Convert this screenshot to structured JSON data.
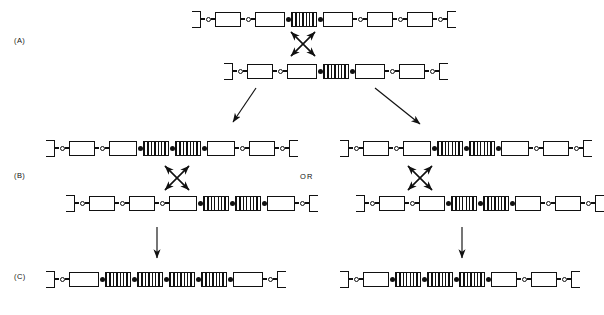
{
  "figure": {
    "ink_color": "#111111",
    "background": "#ffffff"
  },
  "labels": {
    "panel_a": "(A)",
    "panel_b": "(B)",
    "panel_c": "(C)",
    "or": "OR"
  },
  "legend_semantics": {
    "hatch_box": "amplified repeat unit",
    "open_box": "flanking segment",
    "filled_dot": "junction between repeat units",
    "open_dot": "junction between flanking segments",
    "cap": "chromosome arm terminus"
  },
  "rows": {
    "a_top": {
      "name": "chromatid-a1",
      "left_px": 192,
      "top_px": 8,
      "elements": [
        {
          "t": "cap",
          "side": "left",
          "w": 9
        },
        {
          "t": "link",
          "w": 4
        },
        {
          "t": "open"
        },
        {
          "t": "link",
          "w": 4
        },
        {
          "t": "box",
          "w": 26
        },
        {
          "t": "link",
          "w": 4
        },
        {
          "t": "open"
        },
        {
          "t": "link",
          "w": 4
        },
        {
          "t": "box",
          "w": 30
        },
        {
          "t": "fill"
        },
        {
          "t": "hatch",
          "w": 26
        },
        {
          "t": "fill"
        },
        {
          "t": "box",
          "w": 30
        },
        {
          "t": "link",
          "w": 4
        },
        {
          "t": "open"
        },
        {
          "t": "link",
          "w": 4
        },
        {
          "t": "box",
          "w": 26
        },
        {
          "t": "link",
          "w": 4
        },
        {
          "t": "open"
        },
        {
          "t": "link",
          "w": 4
        },
        {
          "t": "box",
          "w": 26
        },
        {
          "t": "link",
          "w": 4
        },
        {
          "t": "open"
        },
        {
          "t": "link",
          "w": 4
        },
        {
          "t": "cap",
          "side": "right",
          "w": 9
        }
      ]
    },
    "a_bottom": {
      "name": "chromatid-a2",
      "left_px": 224,
      "top_px": 60,
      "elements": [
        {
          "t": "cap",
          "side": "left",
          "w": 9
        },
        {
          "t": "link",
          "w": 4
        },
        {
          "t": "open"
        },
        {
          "t": "link",
          "w": 4
        },
        {
          "t": "box",
          "w": 26
        },
        {
          "t": "link",
          "w": 4
        },
        {
          "t": "open"
        },
        {
          "t": "link",
          "w": 4
        },
        {
          "t": "box",
          "w": 30
        },
        {
          "t": "fill"
        },
        {
          "t": "hatch",
          "w": 26
        },
        {
          "t": "fill"
        },
        {
          "t": "box",
          "w": 30
        },
        {
          "t": "link",
          "w": 4
        },
        {
          "t": "open"
        },
        {
          "t": "link",
          "w": 4
        },
        {
          "t": "box",
          "w": 26
        },
        {
          "t": "link",
          "w": 4
        },
        {
          "t": "open"
        },
        {
          "t": "link",
          "w": 4
        },
        {
          "t": "cap",
          "side": "right",
          "w": 9
        }
      ]
    },
    "b_left_top": {
      "name": "chromatid-b-left-1",
      "left_px": 46,
      "top_px": 137,
      "elements": [
        {
          "t": "cap",
          "side": "left",
          "w": 9
        },
        {
          "t": "link",
          "w": 4
        },
        {
          "t": "open"
        },
        {
          "t": "link",
          "w": 4
        },
        {
          "t": "box",
          "w": 26
        },
        {
          "t": "link",
          "w": 4
        },
        {
          "t": "open"
        },
        {
          "t": "link",
          "w": 4
        },
        {
          "t": "box",
          "w": 28
        },
        {
          "t": "fill"
        },
        {
          "t": "hatch",
          "w": 26
        },
        {
          "t": "fill"
        },
        {
          "t": "hatch",
          "w": 26
        },
        {
          "t": "fill"
        },
        {
          "t": "box",
          "w": 28
        },
        {
          "t": "link",
          "w": 4
        },
        {
          "t": "open"
        },
        {
          "t": "link",
          "w": 4
        },
        {
          "t": "box",
          "w": 26
        },
        {
          "t": "link",
          "w": 4
        },
        {
          "t": "open"
        },
        {
          "t": "link",
          "w": 4
        },
        {
          "t": "cap",
          "side": "right",
          "w": 9
        }
      ]
    },
    "b_left_bottom": {
      "name": "chromatid-b-left-2",
      "left_px": 66,
      "top_px": 192,
      "elements": [
        {
          "t": "cap",
          "side": "left",
          "w": 9
        },
        {
          "t": "link",
          "w": 4
        },
        {
          "t": "open"
        },
        {
          "t": "link",
          "w": 4
        },
        {
          "t": "box",
          "w": 26
        },
        {
          "t": "link",
          "w": 4
        },
        {
          "t": "open"
        },
        {
          "t": "link",
          "w": 4
        },
        {
          "t": "box",
          "w": 26
        },
        {
          "t": "link",
          "w": 4
        },
        {
          "t": "open"
        },
        {
          "t": "link",
          "w": 4
        },
        {
          "t": "box",
          "w": 28
        },
        {
          "t": "fill"
        },
        {
          "t": "hatch",
          "w": 26
        },
        {
          "t": "fill"
        },
        {
          "t": "hatch",
          "w": 26
        },
        {
          "t": "fill"
        },
        {
          "t": "box",
          "w": 28
        },
        {
          "t": "link",
          "w": 4
        },
        {
          "t": "open"
        },
        {
          "t": "link",
          "w": 4
        },
        {
          "t": "cap",
          "side": "right",
          "w": 9
        }
      ]
    },
    "b_right_top": {
      "name": "chromatid-b-right-1",
      "left_px": 340,
      "top_px": 137,
      "elements": [
        {
          "t": "cap",
          "side": "left",
          "w": 9
        },
        {
          "t": "link",
          "w": 4
        },
        {
          "t": "open"
        },
        {
          "t": "link",
          "w": 4
        },
        {
          "t": "box",
          "w": 26
        },
        {
          "t": "link",
          "w": 4
        },
        {
          "t": "open"
        },
        {
          "t": "link",
          "w": 4
        },
        {
          "t": "box",
          "w": 28
        },
        {
          "t": "fill"
        },
        {
          "t": "hatch",
          "w": 26
        },
        {
          "t": "fill"
        },
        {
          "t": "hatch",
          "w": 26
        },
        {
          "t": "fill"
        },
        {
          "t": "box",
          "w": 28
        },
        {
          "t": "link",
          "w": 4
        },
        {
          "t": "open"
        },
        {
          "t": "link",
          "w": 4
        },
        {
          "t": "box",
          "w": 26
        },
        {
          "t": "link",
          "w": 4
        },
        {
          "t": "open"
        },
        {
          "t": "link",
          "w": 4
        },
        {
          "t": "cap",
          "side": "right",
          "w": 9
        }
      ]
    },
    "b_right_bottom": {
      "name": "chromatid-b-right-2",
      "left_px": 356,
      "top_px": 192,
      "elements": [
        {
          "t": "cap",
          "side": "left",
          "w": 9
        },
        {
          "t": "link",
          "w": 4
        },
        {
          "t": "open"
        },
        {
          "t": "link",
          "w": 4
        },
        {
          "t": "box",
          "w": 26
        },
        {
          "t": "link",
          "w": 4
        },
        {
          "t": "open"
        },
        {
          "t": "link",
          "w": 4
        },
        {
          "t": "box",
          "w": 26
        },
        {
          "t": "fill"
        },
        {
          "t": "hatch",
          "w": 26
        },
        {
          "t": "fill"
        },
        {
          "t": "hatch",
          "w": 26
        },
        {
          "t": "fill"
        },
        {
          "t": "box",
          "w": 26
        },
        {
          "t": "link",
          "w": 4
        },
        {
          "t": "open"
        },
        {
          "t": "link",
          "w": 4
        },
        {
          "t": "box",
          "w": 26
        },
        {
          "t": "link",
          "w": 4
        },
        {
          "t": "open"
        },
        {
          "t": "link",
          "w": 4
        },
        {
          "t": "cap",
          "side": "right",
          "w": 9
        }
      ]
    },
    "c_left": {
      "name": "chromatid-c-left",
      "left_px": 46,
      "top_px": 268,
      "elements": [
        {
          "t": "cap",
          "side": "left",
          "w": 9
        },
        {
          "t": "link",
          "w": 4
        },
        {
          "t": "open"
        },
        {
          "t": "link",
          "w": 4
        },
        {
          "t": "box",
          "w": 30
        },
        {
          "t": "fill"
        },
        {
          "t": "hatch",
          "w": 26
        },
        {
          "t": "fill"
        },
        {
          "t": "hatch",
          "w": 26
        },
        {
          "t": "fill"
        },
        {
          "t": "hatch",
          "w": 26
        },
        {
          "t": "fill"
        },
        {
          "t": "hatch",
          "w": 26
        },
        {
          "t": "fill"
        },
        {
          "t": "box",
          "w": 30
        },
        {
          "t": "link",
          "w": 4
        },
        {
          "t": "open"
        },
        {
          "t": "link",
          "w": 4
        },
        {
          "t": "cap",
          "side": "right",
          "w": 9
        }
      ]
    },
    "c_right": {
      "name": "chromatid-c-right",
      "left_px": 340,
      "top_px": 268,
      "elements": [
        {
          "t": "cap",
          "side": "left",
          "w": 9
        },
        {
          "t": "link",
          "w": 4
        },
        {
          "t": "open"
        },
        {
          "t": "link",
          "w": 4
        },
        {
          "t": "box",
          "w": 26
        },
        {
          "t": "fill"
        },
        {
          "t": "hatch",
          "w": 26
        },
        {
          "t": "fill"
        },
        {
          "t": "hatch",
          "w": 26
        },
        {
          "t": "fill"
        },
        {
          "t": "hatch",
          "w": 26
        },
        {
          "t": "fill"
        },
        {
          "t": "box",
          "w": 26
        },
        {
          "t": "link",
          "w": 4
        },
        {
          "t": "open"
        },
        {
          "t": "link",
          "w": 4
        },
        {
          "t": "box",
          "w": 26
        },
        {
          "t": "link",
          "w": 4
        },
        {
          "t": "open"
        },
        {
          "t": "link",
          "w": 4
        },
        {
          "t": "cap",
          "side": "right",
          "w": 9
        }
      ]
    }
  },
  "arrows": {
    "cross_a": {
      "name": "crossover-x-panel-a",
      "cx": 303,
      "cy": 44,
      "half": 12
    },
    "cross_b_left": {
      "name": "crossover-x-panel-b-left",
      "cx": 177,
      "cy": 178,
      "half": 12
    },
    "cross_b_right": {
      "name": "crossover-x-panel-b-right",
      "cx": 420,
      "cy": 178,
      "half": 12
    },
    "split_left": {
      "name": "branch-arrow-left",
      "x1": 256,
      "y1": 88,
      "x2": 233,
      "y2": 122
    },
    "split_right": {
      "name": "branch-arrow-right",
      "x1": 375,
      "y1": 88,
      "x2": 420,
      "y2": 124
    },
    "down_left": {
      "name": "result-arrow-left",
      "x1": 157,
      "y1": 227,
      "x2": 157,
      "y2": 258
    },
    "down_right": {
      "name": "result-arrow-right",
      "x1": 462,
      "y1": 227,
      "x2": 462,
      "y2": 258
    }
  },
  "label_positions": {
    "panel_a": {
      "left": 14,
      "top": 36
    },
    "panel_b": {
      "left": 14,
      "top": 171
    },
    "panel_c": {
      "left": 14,
      "top": 272
    },
    "or": {
      "left": 300,
      "top": 172
    }
  }
}
